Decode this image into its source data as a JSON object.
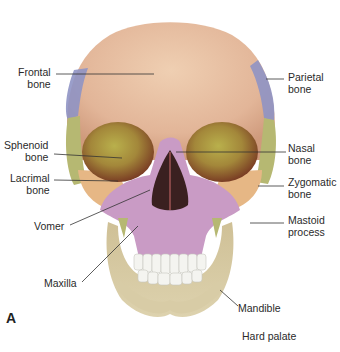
{
  "figure": {
    "letter": "A",
    "colors": {
      "frontal": "#e7c0a0",
      "parietal": "#8f93c4",
      "temporal_green": "#b6b872",
      "sphenoid": "#b8b24e",
      "zygomatic": "#e6b785",
      "maxilla": "#c99bc5",
      "mandible": "#d8cca6",
      "teeth": "#f4f4f0",
      "orbit_dark": "#8a4a2e"
    }
  },
  "labels": {
    "frontal": {
      "line1": "Frontal",
      "line2": "bone"
    },
    "parietal": {
      "line1": "Parietal",
      "line2": "bone"
    },
    "sphenoid": {
      "line1": "Sphenoid",
      "line2": "bone"
    },
    "nasal": {
      "line1": "Nasal",
      "line2": "bone"
    },
    "lacrimal": {
      "line1": "Lacrimal",
      "line2": "bone"
    },
    "zygomatic": {
      "line1": "Zygomatic",
      "line2": "bone"
    },
    "vomer": {
      "line1": "Vomer"
    },
    "mastoid": {
      "line1": "Mastoid",
      "line2": "process"
    },
    "maxilla": {
      "line1": "Maxilla"
    },
    "mandible": {
      "line1": "Mandible"
    },
    "hard_palate": {
      "line1": "Hard palate"
    }
  }
}
